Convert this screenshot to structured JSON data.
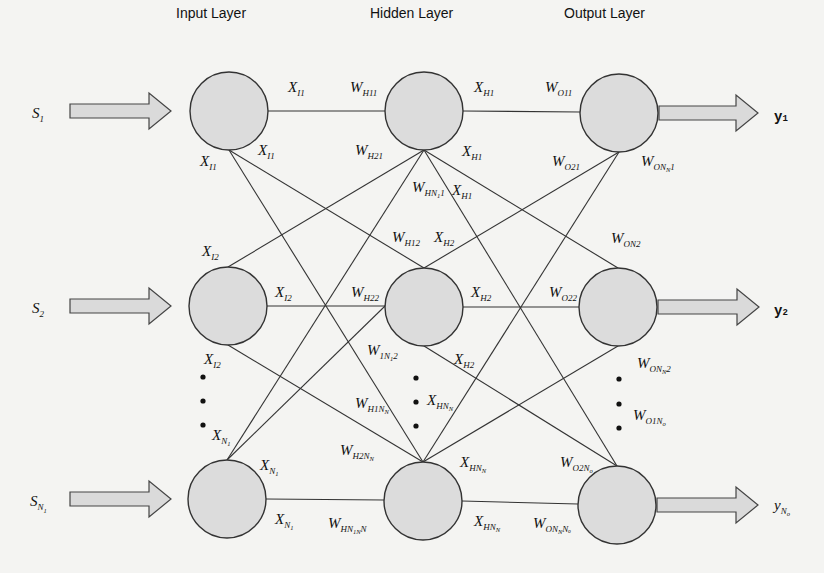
{
  "diagram": {
    "type": "feedforward-neural-network",
    "layers": [
      {
        "id": "input",
        "title": "Input Layer",
        "nodes": 3
      },
      {
        "id": "hidden",
        "title": "Hidden Layer",
        "nodes": 3
      },
      {
        "id": "output",
        "title": "Output Layer",
        "nodes": 3
      }
    ],
    "inputs": [
      {
        "base": "S",
        "sub": "1",
        "subsub": ""
      },
      {
        "base": "S",
        "sub": "2",
        "subsub": ""
      },
      {
        "base": "S",
        "sub": "N",
        "subsub": "1"
      }
    ],
    "outputs": [
      {
        "base": "y",
        "sub": "1",
        "subsub": ""
      },
      {
        "base": "y",
        "sub": "2",
        "subsub": ""
      },
      {
        "base": "y",
        "sub": "N",
        "subsub": "o"
      }
    ],
    "input_edge_labels": [
      {
        "base": "X",
        "sub": "I1",
        "subsub": "",
        "x": 288,
        "y": 92
      },
      {
        "base": "X",
        "sub": "I1",
        "subsub": "",
        "x": 258,
        "y": 155
      },
      {
        "base": "X",
        "sub": "I1",
        "subsub": "",
        "x": 200,
        "y": 166
      },
      {
        "base": "X",
        "sub": "I2",
        "subsub": "",
        "x": 202,
        "y": 256
      },
      {
        "base": "X",
        "sub": "I2",
        "subsub": "",
        "x": 275,
        "y": 297
      },
      {
        "base": "X",
        "sub": "I2",
        "subsub": "",
        "x": 204,
        "y": 364
      },
      {
        "base": "X",
        "sub": "N",
        "subsub": "1",
        "x": 212,
        "y": 440
      },
      {
        "base": "X",
        "sub": "N",
        "subsub": "1",
        "x": 260,
        "y": 470
      },
      {
        "base": "X",
        "sub": "N",
        "subsub": "1",
        "x": 275,
        "y": 524
      }
    ],
    "hidden_weight_labels": [
      {
        "base": "W",
        "sub": "H11",
        "subsub": "",
        "x": 350,
        "y": 92
      },
      {
        "base": "W",
        "sub": "H21",
        "subsub": "",
        "x": 355,
        "y": 155
      },
      {
        "base": "W",
        "sub": "HN",
        "subsub": "1",
        "x": 412,
        "y": 192,
        "tail": "1"
      },
      {
        "base": "W",
        "sub": "H12",
        "subsub": "",
        "x": 392,
        "y": 242
      },
      {
        "base": "W",
        "sub": "H22",
        "subsub": "",
        "x": 351,
        "y": 297
      },
      {
        "base": "W",
        "sub": "1N",
        "subsub": "1",
        "x": 367,
        "y": 355,
        "tail": "2"
      },
      {
        "base": "W",
        "sub": "H1N",
        "subsub": "N",
        "x": 355,
        "y": 408
      },
      {
        "base": "W",
        "sub": "H2N",
        "subsub": "N",
        "x": 340,
        "y": 455
      },
      {
        "base": "W",
        "sub": "HN",
        "subsub": "1N",
        "x": 328,
        "y": 528,
        "tail": "N"
      }
    ],
    "hidden_edge_labels": [
      {
        "base": "X",
        "sub": "H1",
        "subsub": "",
        "x": 474,
        "y": 92
      },
      {
        "base": "X",
        "sub": "H1",
        "subsub": "",
        "x": 462,
        "y": 156
      },
      {
        "base": "X",
        "sub": "H1",
        "subsub": "",
        "x": 452,
        "y": 195
      },
      {
        "base": "X",
        "sub": "H2",
        "subsub": "",
        "x": 434,
        "y": 242
      },
      {
        "base": "X",
        "sub": "H2",
        "subsub": "",
        "x": 471,
        "y": 297
      },
      {
        "base": "X",
        "sub": "H2",
        "subsub": "",
        "x": 454,
        "y": 364
      },
      {
        "base": "X",
        "sub": "HN",
        "subsub": "N",
        "x": 427,
        "y": 405
      },
      {
        "base": "X",
        "sub": "HN",
        "subsub": "N",
        "x": 460,
        "y": 467
      },
      {
        "base": "X",
        "sub": "HN",
        "subsub": "N",
        "x": 474,
        "y": 526
      }
    ],
    "output_weight_labels": [
      {
        "base": "W",
        "sub": "O11",
        "subsub": "",
        "x": 545,
        "y": 92
      },
      {
        "base": "W",
        "sub": "O21",
        "subsub": "",
        "x": 552,
        "y": 166
      },
      {
        "base": "W",
        "sub": "ON",
        "subsub": "N",
        "x": 641,
        "y": 166,
        "tail": "1"
      },
      {
        "base": "W",
        "sub": "ON2",
        "subsub": "",
        "x": 611,
        "y": 243
      },
      {
        "base": "W",
        "sub": "O22",
        "subsub": "",
        "x": 549,
        "y": 297
      },
      {
        "base": "W",
        "sub": "ON",
        "subsub": "N",
        "x": 637,
        "y": 368,
        "tail": "2"
      },
      {
        "base": "W",
        "sub": "O1N",
        "subsub": "o",
        "x": 633,
        "y": 420
      },
      {
        "base": "W",
        "sub": "O2N",
        "subsub": "o",
        "x": 560,
        "y": 467
      },
      {
        "base": "W",
        "sub": "ON",
        "subsub": "N",
        "x": 533,
        "y": 528,
        "tail": "Nₒ"
      }
    ],
    "ellipsis": "…"
  }
}
